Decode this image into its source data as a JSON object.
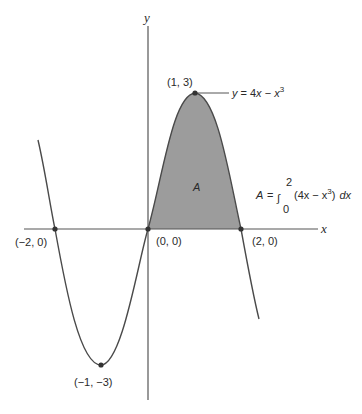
{
  "figure": {
    "function": "y = 4x - x^3",
    "axes": {
      "x_label": "x",
      "y_label": "y"
    },
    "points": [
      {
        "name": "neg-two-zero",
        "label": "(−2, 0)",
        "x": -2,
        "y": 0
      },
      {
        "name": "origin",
        "label": "(0, 0)",
        "x": 0,
        "y": 0
      },
      {
        "name": "two-zero",
        "label": "(2, 0)",
        "x": 2,
        "y": 0
      },
      {
        "name": "local-max",
        "label": "(1, 3)",
        "x": 1,
        "y": 3
      },
      {
        "name": "local-min",
        "label": "(−1, −3)",
        "x": -1,
        "y": -3
      }
    ],
    "curve_label": {
      "y": "y",
      "eq": "= 4",
      "x": "x",
      "minus": " − ",
      "x3": "x",
      "exp": "3"
    },
    "region_label": "A",
    "area_formula": {
      "lhs": "A",
      "eq": "=",
      "integral": "∫",
      "upper": "2",
      "lower": "0",
      "integrand": "(4x − x",
      "exp": "3",
      "close": ")",
      "dx": "dx"
    },
    "colors": {
      "curve": "#4a4a4a",
      "axis": "#555555",
      "shade": "#9c9c9c",
      "point": "#333333"
    }
  }
}
